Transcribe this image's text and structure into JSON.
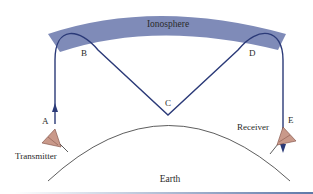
{
  "diagram": {
    "labels": {
      "ionosphere": "Ionosphere",
      "earth": "Earth",
      "transmitter": "Transmitter",
      "receiver": "Receiver",
      "point_a": "A",
      "point_b": "B",
      "point_c": "C",
      "point_d": "D",
      "point_e": "E"
    },
    "colors": {
      "ionosphere_band": "#7f8bb8",
      "ray_path": "#2b3a78",
      "earth_outline": "#333333",
      "antenna_fill": "#c9998a",
      "antenna_stroke": "#7a4a40",
      "bottom_bar_start": "#ffffff",
      "bottom_bar_end": "#5f78a8"
    }
  }
}
